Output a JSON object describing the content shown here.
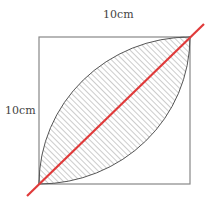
{
  "diagram": {
    "top_dimension_label": "10cm",
    "left_dimension_label": "10cm",
    "colors": {
      "square_stroke": "#888888",
      "arc_stroke": "#555555",
      "hatch": "#999999",
      "diagonal": "#e03a3a",
      "dashed_arc": "#888888"
    }
  }
}
